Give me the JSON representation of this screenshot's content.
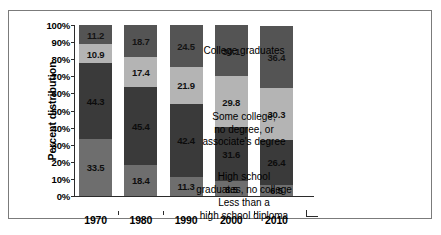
{
  "chart_data": {
    "type": "bar",
    "subtype": "100% stacked bar",
    "title": "",
    "xlabel": "",
    "ylabel": "Percent distribution",
    "categories": [
      "1970",
      "1980",
      "1990",
      "2000",
      "2010"
    ],
    "ylim": [
      0,
      100
    ],
    "ytick_labels": [
      "0%",
      "10%",
      "20%",
      "30%",
      "40%",
      "50%",
      "60%",
      "70%",
      "80%",
      "90%",
      "100%"
    ],
    "ytick_values": [
      0,
      10,
      20,
      30,
      40,
      50,
      60,
      70,
      80,
      90,
      100
    ],
    "grid": false,
    "legend_position": "right",
    "stack_order": "bottom-to-top",
    "series": [
      {
        "name": "Less than a high school diploma",
        "color": "#6e6e6e",
        "values": [
          33.5,
          18.4,
          11.3,
          8.5,
          6.5
        ]
      },
      {
        "name": "High school graduates, no college",
        "color": "#3a3a3a",
        "values": [
          44.3,
          45.4,
          42.4,
          31.6,
          26.4
        ]
      },
      {
        "name": "Some college, no degree, or associate's degree",
        "color": "#b4b4b4",
        "values": [
          10.9,
          17.4,
          21.9,
          29.8,
          30.3
        ]
      },
      {
        "name": "College graduates",
        "color": "#545454",
        "values": [
          11.2,
          18.7,
          24.5,
          30.1,
          36.4
        ]
      }
    ]
  },
  "legend": {
    "entries": [
      {
        "label": "College graduates"
      },
      {
        "label": "Some college,\nno degree, or\nassociate's degree"
      },
      {
        "label": "High school\ngraduates, no college"
      },
      {
        "label": "Less than a\nhigh school diploma"
      }
    ]
  }
}
